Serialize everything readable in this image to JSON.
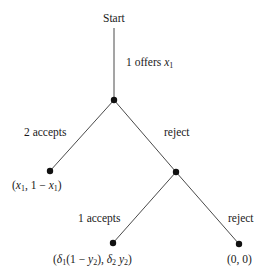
{
  "diagram": {
    "type": "game-tree",
    "root_label": "Start",
    "edges": [
      {
        "from": "start",
        "to": "n1",
        "label": "1 offers x1"
      },
      {
        "from": "n1",
        "to": "leaf1",
        "label": "2 accepts"
      },
      {
        "from": "n1",
        "to": "n2",
        "label": "reject"
      },
      {
        "from": "n2",
        "to": "leaf2",
        "label": "1 accepts"
      },
      {
        "from": "n2",
        "to": "leaf3",
        "label": "reject"
      }
    ],
    "labels": {
      "start": "Start",
      "offer_prefix": "1 offers ",
      "offer_var": "x",
      "offer_sub": "1",
      "accept2": "2 accepts",
      "reject1": "reject",
      "accept1": "1 accepts",
      "reject2": "reject"
    },
    "payoffs": {
      "leaf1": "(x1, 1 − x1)",
      "leaf2": "(δ1(1 − y2), δ2 y2)",
      "leaf3": "(0, 0)"
    },
    "colors": {
      "edge": "#4a4a4a",
      "node": "#111111",
      "text": "#1a1a1a",
      "background": "#ffffff"
    }
  }
}
